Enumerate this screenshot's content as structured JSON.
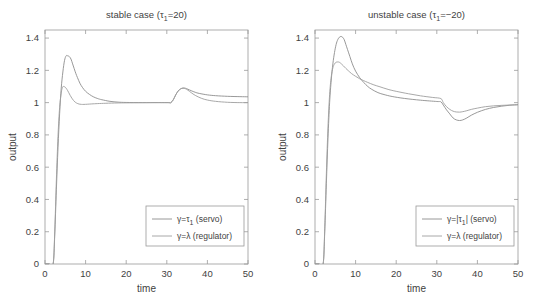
{
  "figure": {
    "width": 539,
    "height": 304,
    "background": "#ffffff",
    "line_color_servo": "#8d8d8d",
    "line_color_regulator": "#9e9e9e",
    "axis_color": "#9a9a9a",
    "text_color": "#3f3f3f"
  },
  "chart_data": [
    {
      "type": "line",
      "panel": "left",
      "title": "stable case (τ₁=20)",
      "title_parts": {
        "main": "stable case (",
        "tau": "τ",
        "sub": "1",
        "tail": "=20)"
      },
      "xlabel": "time",
      "ylabel": "output",
      "xlim": [
        0,
        50
      ],
      "ylim": [
        0,
        1.45
      ],
      "xticks": [
        0,
        10,
        20,
        30,
        40,
        50
      ],
      "xticklabels": [
        "0",
        "10",
        "20",
        "30",
        "40",
        "50"
      ],
      "yticks": [
        0,
        0.2,
        0.4,
        0.6,
        0.8,
        1,
        1.2,
        1.4
      ],
      "yticklabels": [
        "0",
        "0.2",
        "0.4",
        "0.6",
        "0.8",
        "1",
        "1.2",
        "1.4"
      ],
      "grid": false,
      "legend_position": "lower right",
      "series": [
        {
          "name": "γ=τ₁ (servo)",
          "legend_parts": {
            "pre": "γ=τ",
            "sub": "1",
            "post": " (servo)"
          },
          "color": "#8d8d8d",
          "x": [
            0,
            1.0,
            2.0,
            2.4,
            2.8,
            3.2,
            3.6,
            4.0,
            4.4,
            4.8,
            5.2,
            5.6,
            6.0,
            6.4,
            6.8,
            7.2,
            7.6,
            8.0,
            8.6,
            9.2,
            10.0,
            11.0,
            12.0,
            13.0,
            14.0,
            16.0,
            18.0,
            20.0,
            24.0,
            28.0,
            30.5,
            31.0,
            31.6,
            32.2,
            32.8,
            33.4,
            34.0,
            34.6,
            35.2,
            36.0,
            37.0,
            38.0,
            40.0,
            42.0,
            45.0,
            48.0,
            50.0
          ],
          "y": [
            0,
            0,
            0,
            0.18,
            0.46,
            0.72,
            0.93,
            1.09,
            1.19,
            1.26,
            1.29,
            1.29,
            1.285,
            1.27,
            1.24,
            1.21,
            1.18,
            1.155,
            1.12,
            1.095,
            1.07,
            1.05,
            1.035,
            1.025,
            1.018,
            1.008,
            1.003,
            1.001,
            1.0,
            1.0,
            1.0,
            1.0,
            1.018,
            1.048,
            1.072,
            1.085,
            1.09,
            1.089,
            1.083,
            1.074,
            1.064,
            1.057,
            1.048,
            1.043,
            1.039,
            1.037,
            1.036
          ]
        },
        {
          "name": "γ=λ (regulator)",
          "legend_parts": {
            "pre": "γ=λ (regulator)",
            "sub": "",
            "post": ""
          },
          "color": "#9e9e9e",
          "x": [
            0,
            1.0,
            2.0,
            2.4,
            2.8,
            3.2,
            3.6,
            4.0,
            4.3,
            4.6,
            5.0,
            5.4,
            5.8,
            6.2,
            6.6,
            7.0,
            7.4,
            7.8,
            8.4,
            9.0,
            9.6,
            10.4,
            11.5,
            13.0,
            15.0,
            18.0,
            22.0,
            26.0,
            30.0,
            31.0,
            31.6,
            32.2,
            32.8,
            33.4,
            34.0,
            34.6,
            35.2,
            36.0,
            37.0,
            38.5,
            40.0,
            42.0,
            45.0,
            48.0,
            50.0
          ],
          "y": [
            0,
            0,
            0,
            0.2,
            0.52,
            0.79,
            0.97,
            1.06,
            1.095,
            1.1,
            1.095,
            1.082,
            1.064,
            1.045,
            1.028,
            1.014,
            1.004,
            0.997,
            0.991,
            0.989,
            0.989,
            0.99,
            0.992,
            0.994,
            0.996,
            0.998,
            0.999,
            1.0,
            1.0,
            1.0,
            1.018,
            1.048,
            1.072,
            1.085,
            1.09,
            1.086,
            1.077,
            1.062,
            1.045,
            1.027,
            1.016,
            1.008,
            1.002,
            1.0,
            1.0
          ]
        }
      ]
    },
    {
      "type": "line",
      "panel": "right",
      "title": "unstable case (τ₁=−20)",
      "title_parts": {
        "main": "unstable case (",
        "tau": "τ",
        "sub": "1",
        "tail": "=−20)"
      },
      "xlabel": "time",
      "ylabel": "output",
      "xlim": [
        0,
        50
      ],
      "ylim": [
        0,
        1.45
      ],
      "xticks": [
        0,
        10,
        20,
        30,
        40,
        50
      ],
      "xticklabels": [
        "0",
        "10",
        "20",
        "30",
        "40",
        "50"
      ],
      "yticks": [
        0,
        0.2,
        0.4,
        0.6,
        0.8,
        1,
        1.2,
        1.4
      ],
      "yticklabels": [
        "0",
        "0.2",
        "0.4",
        "0.6",
        "0.8",
        "1",
        "1.2",
        "1.4"
      ],
      "grid": false,
      "legend_position": "lower right",
      "series": [
        {
          "name": "γ=|τ₁| (servo)",
          "legend_parts": {
            "pre": "γ=|τ",
            "sub": "1",
            "post": "| (servo)"
          },
          "color": "#8d8d8d",
          "x": [
            0,
            1.0,
            2.0,
            2.4,
            2.8,
            3.2,
            3.6,
            4.0,
            4.4,
            4.8,
            5.2,
            5.6,
            6.0,
            6.4,
            6.8,
            7.2,
            7.6,
            8.0,
            8.6,
            9.2,
            10.0,
            11.0,
            12.0,
            13.0,
            14.0,
            15.5,
            17.0,
            19.0,
            22.0,
            26.0,
            30.0,
            31.0,
            31.6,
            32.4,
            33.2,
            34.0,
            34.8,
            35.6,
            36.4,
            37.4,
            38.5,
            40.0,
            42.0,
            44.0,
            46.0,
            48.0,
            50.0
          ],
          "y": [
            0,
            0,
            0,
            0.2,
            0.5,
            0.78,
            1.0,
            1.14,
            1.24,
            1.31,
            1.36,
            1.39,
            1.405,
            1.41,
            1.405,
            1.39,
            1.36,
            1.33,
            1.285,
            1.24,
            1.195,
            1.155,
            1.125,
            1.1,
            1.082,
            1.062,
            1.05,
            1.038,
            1.026,
            1.015,
            1.007,
            1.005,
            0.985,
            0.955,
            0.93,
            0.905,
            0.893,
            0.889,
            0.893,
            0.905,
            0.922,
            0.94,
            0.958,
            0.97,
            0.978,
            0.984,
            0.988
          ]
        },
        {
          "name": "γ=λ (regulator)",
          "legend_parts": {
            "pre": "γ=λ (regulator)",
            "sub": "",
            "post": ""
          },
          "color": "#9e9e9e",
          "x": [
            0,
            1.0,
            2.0,
            2.4,
            2.8,
            3.2,
            3.6,
            4.0,
            4.4,
            4.8,
            5.2,
            5.6,
            6.0,
            6.5,
            7.0,
            7.6,
            8.2,
            9.0,
            10.0,
            11.0,
            12.0,
            13.0,
            14.5,
            16.0,
            18.0,
            20.0,
            23.0,
            26.0,
            29.0,
            31.0,
            31.6,
            32.4,
            33.2,
            34.0,
            34.8,
            35.6,
            36.4,
            37.4,
            38.5,
            40.0,
            42.0,
            44.0,
            46.0,
            48.0,
            50.0
          ],
          "y": [
            0,
            0,
            0,
            0.22,
            0.56,
            0.85,
            1.05,
            1.16,
            1.215,
            1.24,
            1.25,
            1.252,
            1.25,
            1.24,
            1.228,
            1.212,
            1.198,
            1.18,
            1.163,
            1.148,
            1.136,
            1.125,
            1.11,
            1.098,
            1.082,
            1.07,
            1.055,
            1.042,
            1.032,
            1.025,
            1.0,
            0.975,
            0.958,
            0.947,
            0.942,
            0.941,
            0.944,
            0.95,
            0.958,
            0.966,
            0.975,
            0.98,
            0.983,
            0.985,
            0.986
          ]
        }
      ]
    }
  ]
}
